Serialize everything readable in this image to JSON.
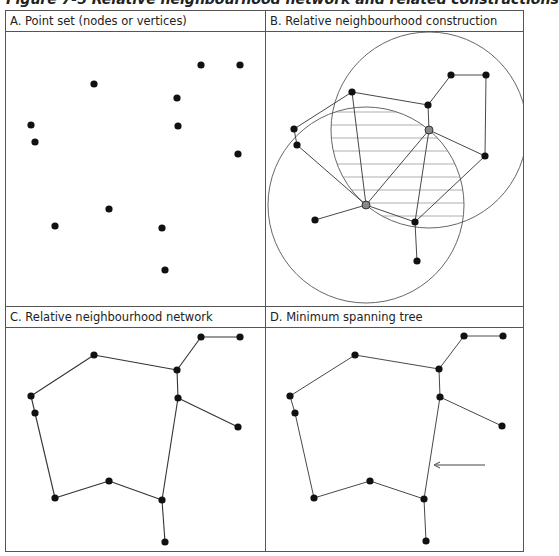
{
  "figure": {
    "title": "Figure 7-5 Relative neighbourhood network and related constructions"
  },
  "panels": [
    {
      "id": "A",
      "label": "A. Point set (nodes or vertices)"
    },
    {
      "id": "B",
      "label": "B. Relative neighbourhood construction"
    },
    {
      "id": "C",
      "label": "C. Relative neighbourhood network"
    },
    {
      "id": "D",
      "label": "D. Minimum spanning tree"
    }
  ],
  "colors": {
    "node": "#111111",
    "highlight_node": "#888888",
    "edge": "#333333",
    "circle": "#555555",
    "hatch": "#999999",
    "border": "#555555"
  },
  "nodes": [
    {
      "id": 1,
      "x": 201,
      "y": 65
    },
    {
      "id": 2,
      "x": 240,
      "y": 65
    },
    {
      "id": 3,
      "x": 94,
      "y": 84
    },
    {
      "id": 4,
      "x": 177,
      "y": 98
    },
    {
      "id": 5,
      "x": 31,
      "y": 125
    },
    {
      "id": 6,
      "x": 178,
      "y": 126
    },
    {
      "id": 7,
      "x": 35,
      "y": 142
    },
    {
      "id": 8,
      "x": 238,
      "y": 154
    },
    {
      "id": 9,
      "x": 109,
      "y": 209
    },
    {
      "id": 10,
      "x": 55,
      "y": 226
    },
    {
      "id": 11,
      "x": 162,
      "y": 228
    },
    {
      "id": 12,
      "x": 165,
      "y": 270
    }
  ],
  "network_edges": [
    [
      1,
      2
    ],
    [
      1,
      4
    ],
    [
      3,
      4
    ],
    [
      3,
      5
    ],
    [
      4,
      6
    ],
    [
      5,
      7
    ],
    [
      6,
      8
    ],
    [
      6,
      11
    ],
    [
      7,
      10
    ],
    [
      9,
      10
    ],
    [
      9,
      11
    ],
    [
      11,
      12
    ]
  ],
  "construction": {
    "highlight_pair": [
      6,
      11
    ],
    "extra_edges": [
      [
        6,
        11
      ],
      [
        3,
        11
      ],
      [
        7,
        11
      ],
      [
        11,
        10
      ],
      [
        8,
        12
      ]
    ],
    "note": "Two circles centred on the highlighted pair, radius equal to their separation; shaded lune between them"
  },
  "mst_arrow": {
    "label": "",
    "points_to_edge": [
      6,
      11
    ]
  }
}
